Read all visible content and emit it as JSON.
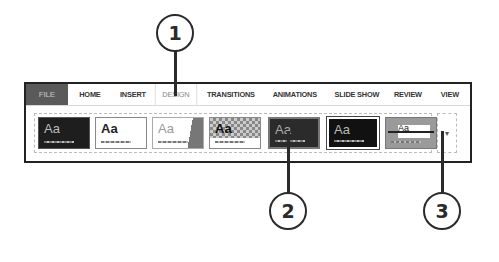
{
  "ribbon": {
    "tabs": [
      {
        "label": "FILE",
        "state": "file"
      },
      {
        "label": "HOME",
        "state": "normal"
      },
      {
        "label": "INSERT",
        "state": "normal"
      },
      {
        "label": "DESIGN",
        "state": "active"
      },
      {
        "label": "TRANSITIONS",
        "state": "normal"
      },
      {
        "label": "ANIMATIONS",
        "state": "normal"
      },
      {
        "label": "SLIDE SHOW",
        "state": "normal"
      },
      {
        "label": "REVIEW",
        "state": "normal"
      },
      {
        "label": "VIEW",
        "state": "normal"
      }
    ]
  },
  "themes": {
    "items": [
      {
        "label": "Aa",
        "style": "dark"
      },
      {
        "label": "Aa",
        "style": "white"
      },
      {
        "label": "Aa",
        "style": "facet"
      },
      {
        "label": "Aa",
        "style": "checker"
      },
      {
        "label": "Aa",
        "style": "dark-gray"
      },
      {
        "label": "Aa",
        "style": "black"
      },
      {
        "label": "Aa",
        "style": "gray-band"
      }
    ],
    "more_label": "▾"
  },
  "callouts": [
    {
      "number": "1"
    },
    {
      "number": "2"
    },
    {
      "number": "3"
    }
  ]
}
